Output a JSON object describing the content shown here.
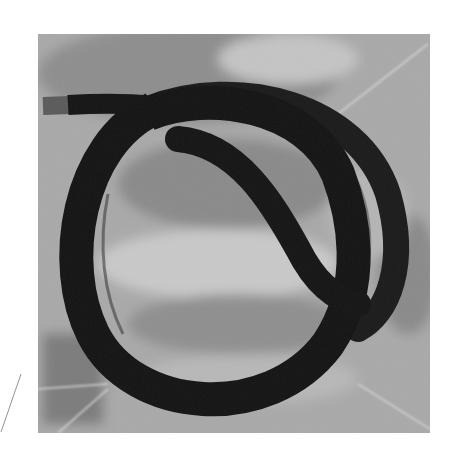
{
  "image": {
    "subject": "coiled black rubber tube on translucent plastic surface",
    "style": "grayscale photograph",
    "colors": {
      "page_background": "#ffffff",
      "photo_background": "#a8a8a8",
      "tube": "#161616",
      "highlight": "#d8d8d8",
      "shadow": "#7a7a7a"
    }
  }
}
